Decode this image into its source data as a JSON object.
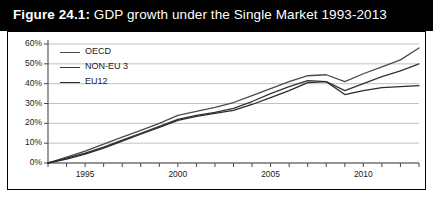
{
  "figure": {
    "label": "Figure 24.1:",
    "title_rest": " GDP growth under the Single Market 1993-2013",
    "title_full": "Figure 24.1: GDP growth under the Single Market 1993-2013",
    "title_bg": "#000000",
    "title_fg": "#ffffff"
  },
  "chart_data": {
    "type": "line",
    "title": "GDP growth under the Single Market 1993-2013",
    "xlabel": "",
    "ylabel": "",
    "xlim": [
      1993,
      2013
    ],
    "ylim": [
      0,
      60
    ],
    "grid": true,
    "legend_position": "top-left",
    "ytick_labels": [
      "0%",
      "10%",
      "20%",
      "30%",
      "40%",
      "50%",
      "60%"
    ],
    "ytick_values": [
      0,
      10,
      20,
      30,
      40,
      50,
      60
    ],
    "xtick_values": [
      1993,
      1994,
      1995,
      1996,
      1997,
      1998,
      1999,
      2000,
      2001,
      2002,
      2003,
      2004,
      2005,
      2006,
      2007,
      2008,
      2009,
      2010,
      2011,
      2012,
      2013
    ],
    "xtick_labels_shown": [
      "1995",
      "2000",
      "2005",
      "2010"
    ],
    "xtick_labels_shown_values": [
      1995,
      2000,
      2005,
      2010
    ],
    "x": [
      1993,
      1994,
      1995,
      1996,
      1997,
      1998,
      1999,
      2000,
      2001,
      2002,
      2003,
      2004,
      2005,
      2006,
      2007,
      2008,
      2009,
      2010,
      2011,
      2012,
      2013
    ],
    "series": [
      {
        "name": "OECD",
        "color": "#4a4a4a",
        "values": [
          0,
          3,
          6,
          9.5,
          13,
          16.5,
          20,
          24,
          26,
          28,
          30.5,
          34,
          37.5,
          41,
          44,
          44.5,
          41,
          45,
          48.5,
          52,
          58
        ]
      },
      {
        "name": "NON-EU 3",
        "color": "#333333",
        "values": [
          0,
          2.5,
          5,
          8,
          11.5,
          15,
          18.5,
          22,
          24,
          25.5,
          27.5,
          31,
          35,
          38.5,
          41.5,
          41,
          36.5,
          40,
          43.5,
          46.5,
          50
        ]
      },
      {
        "name": "EU12",
        "color": "#2b2b2b",
        "values": [
          0,
          2,
          4.5,
          7.5,
          11,
          14.5,
          18,
          21.5,
          23.5,
          25,
          26.5,
          29.5,
          33,
          36.5,
          40.5,
          41,
          34.5,
          36.5,
          38,
          38.5,
          39
        ]
      }
    ]
  },
  "legend": {
    "items": [
      {
        "label": "OECD"
      },
      {
        "label": "NON-EU 3"
      },
      {
        "label": "EU12"
      }
    ]
  }
}
